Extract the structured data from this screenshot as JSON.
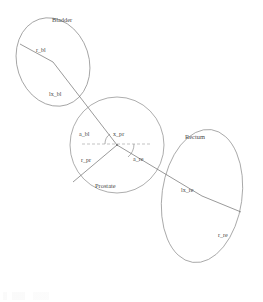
{
  "figure": {
    "title": "",
    "background_color": "#ffffff",
    "line_color": "#8a8a8a",
    "text_color": "#4a4a4a"
  },
  "organs": [
    {
      "id": "bladder",
      "label": "Bladder",
      "label_x": 52,
      "label_y": 22,
      "cx": 53,
      "cy": 62,
      "rx": 36,
      "ry": 45,
      "rotation": -18
    },
    {
      "id": "prostate",
      "label": "Prostate",
      "label_x": 95,
      "label_y": 188,
      "cx": 117,
      "cy": 145,
      "rx": 47,
      "ry": 48,
      "rotation": 0
    },
    {
      "id": "rectum",
      "label": "Rectum",
      "label_x": 185,
      "label_y": 139,
      "cx": 202,
      "cy": 196,
      "rx": 40,
      "ry": 67,
      "rotation": 8
    }
  ],
  "measures": [
    {
      "id": "r_bl",
      "label": "r_bl",
      "label_x": 36,
      "label_y": 52,
      "description": "bladder radius"
    },
    {
      "id": "lx_bl",
      "label": "lx_bl",
      "label_x": 49,
      "label_y": 96,
      "description": "bladder to prostate distance"
    },
    {
      "id": "a_bl",
      "label": "a_bl",
      "label_x": 79,
      "label_y": 136,
      "description": "bladder angle"
    },
    {
      "id": "x_pr",
      "label": "x_pr",
      "label_x": 113,
      "label_y": 136,
      "description": "prostate centre"
    },
    {
      "id": "r_pr",
      "label": "r_pr",
      "label_x": 81,
      "label_y": 162,
      "description": "prostate radius"
    },
    {
      "id": "a_re",
      "label": "a_re",
      "label_x": 133,
      "label_y": 161,
      "description": "rectum angle"
    },
    {
      "id": "lx_re",
      "label": "lx_re",
      "label_x": 181,
      "label_y": 192,
      "description": "prostate to rectum distance"
    },
    {
      "id": "r_re",
      "label": "r_re",
      "label_x": 218,
      "label_y": 237,
      "description": "rectum radius"
    }
  ],
  "geometry": {
    "prostate_center": {
      "x": 117,
      "y": 145
    },
    "bladder_center": {
      "x": 53,
      "y": 62
    },
    "rectum_center": {
      "x": 202,
      "y": 196
    },
    "bladder_radius_edge": {
      "x": 20,
      "y": 44
    },
    "prostate_radius_edge": {
      "x": 73,
      "y": 182
    },
    "rectum_radius_edge": {
      "x": 241,
      "y": 212
    },
    "axis_start": {
      "x": 82,
      "y": 144
    },
    "axis_end": {
      "x": 152,
      "y": 144
    }
  }
}
